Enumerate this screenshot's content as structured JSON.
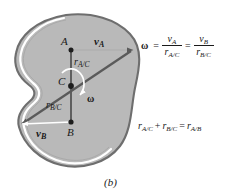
{
  "figure": {
    "caption": "(b)",
    "body_fill": "#b9b9b9",
    "body_outline": "#6e6e6e",
    "body_highlight": "#ffffff",
    "line_color": "#5a5a5a",
    "points": [
      {
        "name": "A",
        "label": "A",
        "x": 71,
        "y": 50
      },
      {
        "name": "C",
        "label": "C",
        "x": 71,
        "y": 86
      },
      {
        "name": "B",
        "label": "B",
        "x": 71,
        "y": 122
      }
    ],
    "vectors": [
      {
        "name": "v-a",
        "symbol": "v",
        "subscript": "A",
        "direction": "right"
      },
      {
        "name": "v-b",
        "symbol": "v",
        "subscript": "B",
        "direction": "left"
      }
    ],
    "radius_labels": [
      {
        "name": "r-a-c",
        "symbol": "r",
        "subscript": "A/C"
      },
      {
        "name": "r-b-c",
        "symbol": "r",
        "subscript": "B/C"
      }
    ],
    "omega": {
      "symbol": "ω",
      "rotation_sense": "clockwise"
    }
  },
  "equations": {
    "angular_velocity": {
      "omega": "ω",
      "equals": "=",
      "first_num": "v",
      "first_num_sub": "A",
      "first_den": "r",
      "first_den_sub": "A/C",
      "middle_equals": "=",
      "second_num": "v",
      "second_num_sub": "B",
      "second_den": "r",
      "second_den_sub": "B/C"
    },
    "position_sum": {
      "term1": "r",
      "term1_sub": "A/C",
      "plus": "+",
      "term2": "r",
      "term2_sub": "B/C",
      "equals": "=",
      "term3": "r",
      "term3_sub": "A/B"
    }
  }
}
